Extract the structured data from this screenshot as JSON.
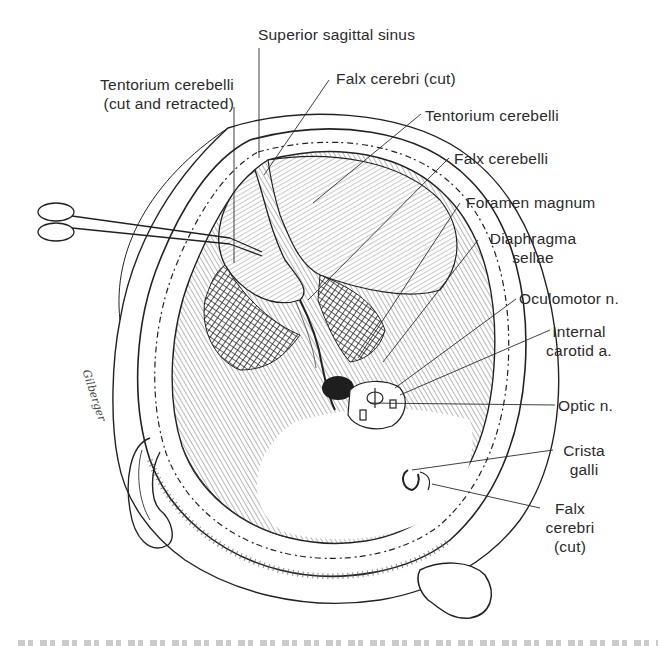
{
  "figure": {
    "labels": {
      "superior_sagittal_sinus": "Superior sagittal sinus",
      "tentorium_cut_l1": "Tentorium cerebelli",
      "tentorium_cut_l2": "(cut and retracted)",
      "falx_cerebri_cut_top": "Falx cerebri (cut)",
      "tentorium_cerebelli": "Tentorium cerebelli",
      "falx_cerebelli": "Falx cerebelli",
      "foramen_magnum": "Foramen magnum",
      "diaphragma_l1": "Diaphragma",
      "diaphragma_l2": "sellae",
      "oculomotor": "Oculomotor n.",
      "internal_carotid_l1": "Internal",
      "internal_carotid_l2": "carotid a.",
      "optic": "Optic n.",
      "crista_l1": "Crista",
      "crista_l2": "galli",
      "falx_bottom_l1": "Falx",
      "falx_bottom_l2": "cerebri",
      "falx_bottom_l3": "(cut)"
    },
    "artist_signature": "Gilberger",
    "colors": {
      "ink": "#2b2b2b",
      "background": "#ffffff"
    }
  }
}
